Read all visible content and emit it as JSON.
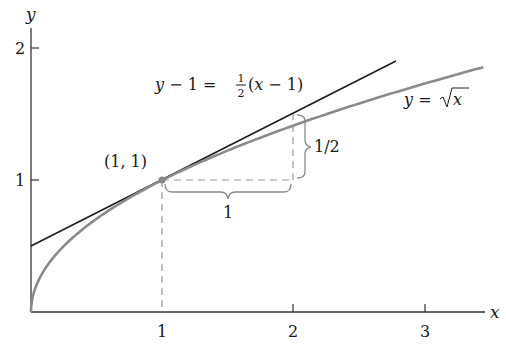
{
  "chart_data": {
    "type": "line",
    "title": "",
    "xlabel": "x",
    "ylabel": "y",
    "xlim": [
      0,
      3.45
    ],
    "ylim": [
      0,
      2.1
    ],
    "x_ticks": [
      "1",
      "2",
      "3"
    ],
    "y_ticks": [
      "1",
      "2"
    ],
    "grid": false,
    "series": [
      {
        "name": "y = √x",
        "function": "sqrt(x)",
        "x_range": [
          0,
          3.44
        ],
        "color": "#8a8a8a"
      },
      {
        "name": "y − 1 = ½(x − 1)",
        "function": "0.5*x + 0.5",
        "x_range": [
          0,
          2.78
        ],
        "color": "#1a1a1a"
      }
    ],
    "annotations": [
      {
        "type": "point",
        "x": 1,
        "y": 1,
        "label": "(1, 1)"
      },
      {
        "type": "brace-horizontal",
        "from": [
          1,
          1
        ],
        "to": [
          2,
          1
        ],
        "label": "1"
      },
      {
        "type": "brace-vertical",
        "from": [
          2,
          1
        ],
        "to": [
          2,
          1.5
        ],
        "label": "1/2"
      },
      {
        "type": "dashed-line",
        "from": [
          1,
          0
        ],
        "to": [
          1,
          1
        ]
      },
      {
        "type": "dashed-line",
        "from": [
          1,
          1
        ],
        "to": [
          2,
          1
        ]
      },
      {
        "type": "dashed-line",
        "from": [
          2,
          1
        ],
        "to": [
          2,
          1.5
        ]
      }
    ]
  },
  "labels": {
    "x_axis": "x",
    "y_axis": "y",
    "x_tick_1": "1",
    "x_tick_2": "2",
    "x_tick_3": "3",
    "y_tick_1": "1",
    "y_tick_2": "2",
    "tangent_lhs": "y − 1 = ",
    "tangent_num": "1",
    "tangent_den": "2",
    "tangent_rhs": "(x − 1)",
    "curve_label_lhs": "y = ",
    "curve_label_rad": "x",
    "point_label": "(1, 1)",
    "run_label": "1",
    "rise_label": "1/2"
  }
}
